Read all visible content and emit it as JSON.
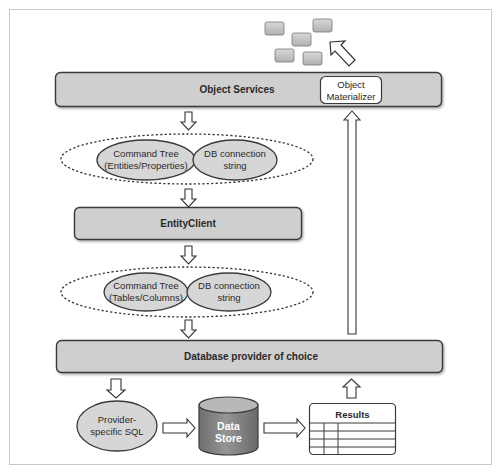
{
  "diagram": {
    "colors": {
      "frame_border": "#c8c8c8",
      "bar_fill": "#cfcfcf",
      "bar_stroke": "#3a3a3a",
      "ellipse_fill": "#d6d6d6",
      "cylinder_fill": "#8a8a8a",
      "cylinder_top": "#b4b4b4",
      "object_block_fill": "#c4c4c4",
      "arrow_fill": "#ffffff",
      "arrow_stroke": "#333333"
    },
    "object_services": {
      "label": "Object Services",
      "materializer": {
        "line1": "Object",
        "line2": "Materializer"
      }
    },
    "command_group_1": {
      "command_tree": {
        "line1": "Command Tree",
        "line2": "(Entities/Properties)"
      },
      "connection": {
        "line1": "DB connection",
        "line2": "string"
      }
    },
    "entity_client": {
      "label": "EntityClient"
    },
    "command_group_2": {
      "command_tree": {
        "line1": "Command Tree",
        "line2": "(Tables/Columns)"
      },
      "connection": {
        "line1": "DB connection",
        "line2": "string"
      }
    },
    "database_provider": {
      "label": "Database provider of choice"
    },
    "provider_sql": {
      "line1": "Provider-",
      "line2": "specific SQL"
    },
    "data_store": {
      "line1": "Data",
      "line2": "Store"
    },
    "results": {
      "label": "Results"
    },
    "objects": {
      "icon": "object-blocks-icon",
      "count": 5
    },
    "arrows": [
      {
        "name": "object-services-to-command-tree",
        "direction": "down"
      },
      {
        "name": "command-tree-to-entity-client",
        "direction": "down"
      },
      {
        "name": "entity-client-to-command-tree",
        "direction": "down"
      },
      {
        "name": "command-tree-to-provider",
        "direction": "down"
      },
      {
        "name": "provider-to-sql",
        "direction": "down"
      },
      {
        "name": "sql-to-data-store",
        "direction": "right"
      },
      {
        "name": "data-store-to-results",
        "direction": "right"
      },
      {
        "name": "results-to-provider",
        "direction": "up"
      },
      {
        "name": "provider-to-materializer",
        "direction": "up"
      },
      {
        "name": "materializer-to-objects",
        "direction": "up-left"
      }
    ]
  }
}
